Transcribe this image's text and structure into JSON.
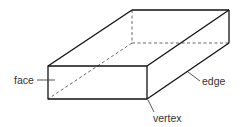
{
  "diagram": {
    "labels": {
      "face": "face",
      "edge": "edge",
      "vertex": "vertex"
    },
    "colors": {
      "line": "#111111",
      "hidden_line": "#555555",
      "label": "#333333",
      "background": "#ffffff"
    }
  }
}
